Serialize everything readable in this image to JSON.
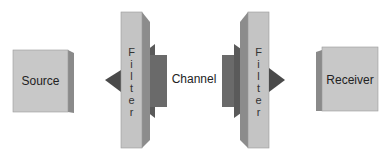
{
  "diagram": {
    "source": {
      "label": "Source"
    },
    "channel": {
      "label": "Channel"
    },
    "receiver": {
      "label": "Receiver"
    },
    "filter_left": {
      "letters": [
        "F",
        "i",
        "l",
        "t",
        "e",
        "r"
      ]
    },
    "filter_right": {
      "letters": [
        "F",
        "i",
        "l",
        "t",
        "e",
        "r"
      ]
    }
  },
  "colors": {
    "box_front": "#c8c8c8",
    "box_side": "#8a8a8a",
    "filter_front": "#c4c4c4",
    "filter_side": "#8c8c8c",
    "arrow_dark": "#4a4a4a",
    "channel_block": "#6a6a6a"
  }
}
